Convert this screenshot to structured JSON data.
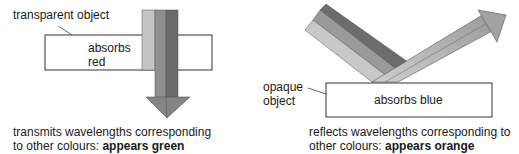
{
  "left_panel": {
    "object_label": "transparent object",
    "box_text_line1": "absorbs",
    "box_text_line2": "red",
    "caption_line1": "transmits wavelengths corresponding",
    "caption_line2_prefix": "to other colours: ",
    "caption_line2_bold": "appears green",
    "beam_colors": [
      "#c4c4c4",
      "#8f8f8f",
      "#6a6a6a"
    ]
  },
  "right_panel": {
    "object_label_line1": "opaque",
    "object_label_line2": "object",
    "box_text": "absorbs blue",
    "caption_line1": "reflects wavelengths corresponding to",
    "caption_line2_prefix": "other colours: ",
    "caption_line2_bold": "appears orange",
    "incoming_beam_colors": [
      "#6c6c6c",
      "#9a9a9a",
      "#c8c8c8"
    ],
    "reflected_beam_color": "#b0b0b0"
  }
}
